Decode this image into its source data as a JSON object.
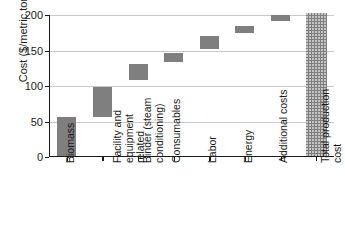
{
  "chart_data": {
    "type": "bar",
    "chart_subtype": "waterfall",
    "title": "",
    "xlabel": "",
    "ylabel": "Cost ($/metric ton)",
    "ylim": [
      0,
      200
    ],
    "yticks": [
      0,
      50,
      100,
      150,
      200
    ],
    "ytick_labels": [
      "0",
      "50",
      "100",
      "150",
      "200"
    ],
    "grid": true,
    "grid_axis": "y",
    "legend": false,
    "categories": [
      "Biomass",
      "Facility and equipment related",
      "Binder (steam conditioning)",
      "Consumables",
      "Labor",
      "Energy",
      "Additional costs",
      "Total production cost"
    ],
    "category_lines": [
      [
        "Biomass"
      ],
      [
        "Facility and",
        "equipment",
        "related"
      ],
      [
        "Binder (steam",
        "conditioning)"
      ],
      [
        "Consumables"
      ],
      [
        "Labor"
      ],
      [
        "Energy"
      ],
      [
        "Additional costs"
      ],
      [
        "Total production",
        "cost"
      ]
    ],
    "bars": [
      {
        "label": "Biomass",
        "base": 0,
        "top": 56,
        "value": 56,
        "is_total": false
      },
      {
        "label": "Facility and equipment related",
        "base": 56,
        "top": 98,
        "value": 42,
        "is_total": false
      },
      {
        "label": "Binder (steam conditioning)",
        "base": 109,
        "top": 131,
        "value": 22,
        "is_total": false
      },
      {
        "label": "Consumables",
        "base": 134,
        "top": 146,
        "value": 12,
        "is_total": false
      },
      {
        "label": "Labor",
        "base": 152,
        "top": 171,
        "value": 19,
        "is_total": false
      },
      {
        "label": "Energy",
        "base": 174,
        "top": 185,
        "value": 11,
        "is_total": false
      },
      {
        "label": "Additional costs",
        "base": 192,
        "top": 200,
        "value": 8,
        "is_total": false
      },
      {
        "label": "Total production cost",
        "base": 0,
        "top": 203,
        "value": 203,
        "is_total": true
      }
    ],
    "bar_color": "#7f7f7f",
    "total_bar_color": "#7f7f7f",
    "total_bar_pattern": "dotted-hatch",
    "axis_color": "#1a1a1a",
    "gridline_color": "#c9c9c9",
    "background_color": "#ffffff"
  }
}
